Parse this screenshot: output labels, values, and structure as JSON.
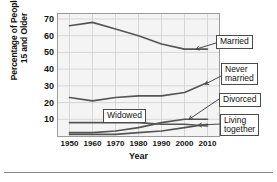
{
  "chart_data": {
    "type": "line",
    "title": "",
    "xlabel": "Year",
    "ylabel": "Percentage of People 15 and Older",
    "ylabel_line1": "Percentage of People",
    "ylabel_line2": "15 and Older",
    "x": [
      1950,
      1960,
      1970,
      1980,
      1990,
      2000,
      2010
    ],
    "xticklabels": [
      "1950",
      "1960",
      "1970",
      "1980",
      "1990",
      "2000",
      "2010"
    ],
    "yticklabels": [
      "10",
      "20",
      "30",
      "40",
      "50",
      "60",
      "70"
    ],
    "yticks": [
      10,
      20,
      30,
      40,
      50,
      60,
      70
    ],
    "xlim": [
      1945,
      2015
    ],
    "ylim": [
      0,
      73
    ],
    "grid": true,
    "grid_color": "#cfcfcf",
    "plot_bg": "#f4f4f4",
    "line_color": "#555555",
    "legend_position": "callout-labels-right",
    "series": [
      {
        "name": "Married",
        "label": "Married",
        "values": [
          66,
          68,
          64,
          60,
          55,
          52,
          52
        ]
      },
      {
        "name": "Never married",
        "label": "Never married",
        "label_line1": "Never",
        "label_line2": "married",
        "values": [
          23,
          21,
          23,
          24,
          24,
          26,
          32
        ]
      },
      {
        "name": "Widowed",
        "label": "Widowed",
        "values": [
          8,
          8,
          8,
          8,
          7,
          7,
          6
        ]
      },
      {
        "name": "Divorced",
        "label": "Divorced",
        "values": [
          2,
          2,
          3,
          5,
          8,
          10,
          10
        ]
      },
      {
        "name": "Living together",
        "label": "Living together",
        "label_line1": "Living",
        "label_line2": "together",
        "values": [
          1,
          1,
          1,
          2,
          3,
          5,
          7
        ]
      }
    ],
    "annotations": [
      {
        "text": "Married",
        "series": "Married"
      },
      {
        "text": "Never married",
        "series": "Never married"
      },
      {
        "text": "Divorced",
        "series": "Divorced"
      },
      {
        "text": "Widowed",
        "series": "Widowed"
      },
      {
        "text": "Living together",
        "series": "Living together"
      }
    ]
  }
}
